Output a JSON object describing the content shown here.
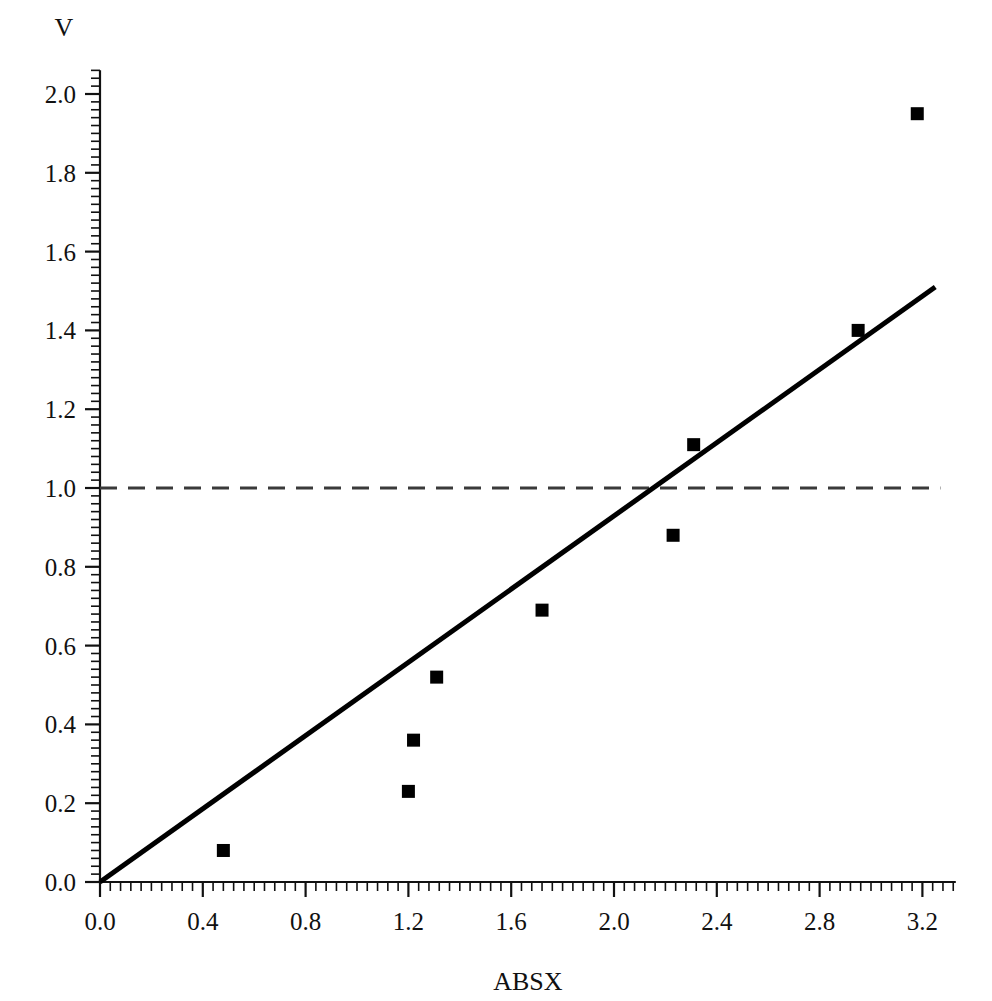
{
  "chart_data": {
    "type": "scatter",
    "title": "",
    "xlabel": "ABSX",
    "ylabel": "V",
    "xlim": [
      0.0,
      3.33
    ],
    "ylim": [
      0.0,
      2.06
    ],
    "grid": false,
    "legend": "none",
    "x_ticks": [
      "0.0",
      "0.4",
      "0.8",
      "1.2",
      "1.6",
      "2.0",
      "2.4",
      "2.8",
      "3.2"
    ],
    "x_tick_values": [
      0.0,
      0.4,
      0.8,
      1.2,
      1.6,
      2.0,
      2.4,
      2.8,
      3.2
    ],
    "x_minor_per_major": 10,
    "y_ticks": [
      "0.0",
      "0.2",
      "0.4",
      "0.6",
      "0.8",
      "1.0",
      "1.2",
      "1.4",
      "1.6",
      "1.8",
      "2.0"
    ],
    "y_tick_values": [
      0.0,
      0.2,
      0.4,
      0.6,
      0.8,
      1.0,
      1.2,
      1.4,
      1.6,
      1.8,
      2.0
    ],
    "y_minor_per_major": 10,
    "series": [
      {
        "name": "observations",
        "marker": "square",
        "color": "#000000",
        "x": [
          0.48,
          1.2,
          1.22,
          1.31,
          1.72,
          2.23,
          2.31,
          2.95,
          3.18
        ],
        "y": [
          0.08,
          0.23,
          0.36,
          0.52,
          0.69,
          0.88,
          1.11,
          1.4,
          1.95
        ]
      }
    ],
    "fit_line": {
      "name": "fitted-line",
      "color": "#000000",
      "style": "solid",
      "x": [
        0.0,
        3.25
      ],
      "y": [
        0.0,
        1.51
      ]
    },
    "reference_line": {
      "name": "unity-reference",
      "color": "#3a3a3a",
      "style": "dashed",
      "orientation": "horizontal",
      "y": 1.0,
      "x_start": 0.0,
      "x_end": 3.27
    }
  },
  "labels": {
    "y_axis_title": "V",
    "x_axis_title": "ABSX"
  }
}
